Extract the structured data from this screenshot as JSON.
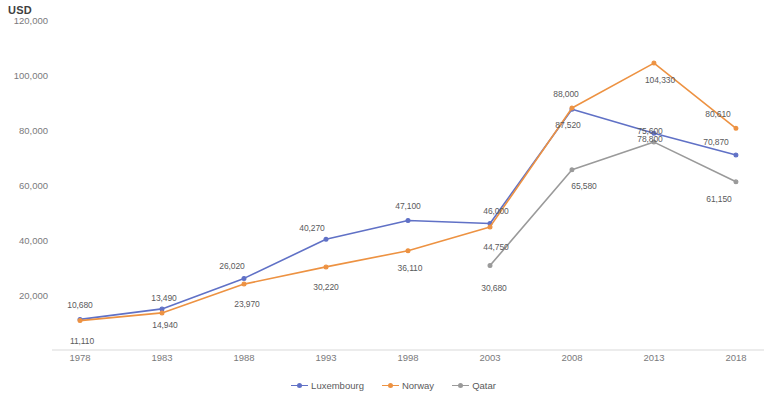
{
  "chart_data": {
    "type": "line",
    "title": "",
    "ylabel": "USD",
    "xlabel": "",
    "ylim": [
      0,
      120000
    ],
    "ytick_labels": [
      "120,000",
      "100,000",
      "80,000",
      "60,000",
      "40,000",
      "20,000"
    ],
    "ytick_values": [
      120000,
      100000,
      80000,
      60000,
      40000,
      20000
    ],
    "categories": [
      "1978",
      "1983",
      "1988",
      "1993",
      "1998",
      "2003",
      "2008",
      "2013",
      "2018"
    ],
    "x": [
      1978,
      1983,
      1988,
      1993,
      1998,
      2003,
      2008,
      2013,
      2018
    ],
    "grid": false,
    "legend_position": "bottom",
    "series": [
      {
        "name": "Luxembourg",
        "color": "#6071c6",
        "values": [
          11110,
          14940,
          26020,
          40270,
          47100,
          46000,
          87520,
          78800,
          70870
        ],
        "labels": [
          "11,110",
          "14,940",
          "26,020",
          "40,270",
          "47,100",
          "46,000",
          "87,520",
          "78,800",
          "70,870"
        ]
      },
      {
        "name": "Norway",
        "color": "#ed9242",
        "values": [
          10680,
          13490,
          23970,
          30220,
          36110,
          44750,
          88000,
          104330,
          80610
        ],
        "labels": [
          "10,680",
          "13,490",
          "23,970",
          "30,220",
          "36,110",
          "44,750",
          "88,000",
          "104,330",
          "80,610"
        ]
      },
      {
        "name": "Qatar",
        "color": "#9a9a9a",
        "values": [
          null,
          null,
          null,
          null,
          null,
          30680,
          65580,
          75600,
          61150
        ],
        "labels": [
          null,
          null,
          null,
          null,
          null,
          "30,680",
          "65,580",
          "75,600",
          "61,150"
        ]
      }
    ],
    "point_labels": [
      {
        "text": "10,680",
        "x": 1978,
        "y": 10680,
        "dx": 0,
        "dy": -16,
        "series": "Norway"
      },
      {
        "text": "11,110",
        "x": 1978,
        "y": 11110,
        "dx": 2,
        "dy": 22,
        "series": "Luxembourg"
      },
      {
        "text": "13,490",
        "x": 1983,
        "y": 13490,
        "dx": 2,
        "dy": -15,
        "series": "Norway"
      },
      {
        "text": "14,940",
        "x": 1983,
        "y": 14940,
        "dx": 3,
        "dy": 16,
        "series": "Luxembourg"
      },
      {
        "text": "26,020",
        "x": 1988,
        "y": 26020,
        "dx": -12,
        "dy": -12,
        "series": "Luxembourg"
      },
      {
        "text": "23,970",
        "x": 1988,
        "y": 23970,
        "dx": 3,
        "dy": 20,
        "series": "Norway"
      },
      {
        "text": "40,270",
        "x": 1993,
        "y": 40270,
        "dx": -14,
        "dy": -11,
        "series": "Luxembourg"
      },
      {
        "text": "30,220",
        "x": 1993,
        "y": 30220,
        "dx": 0,
        "dy": 20,
        "series": "Norway"
      },
      {
        "text": "47,100",
        "x": 1998,
        "y": 47100,
        "dx": 0,
        "dy": -14,
        "series": "Luxembourg"
      },
      {
        "text": "36,110",
        "x": 1998,
        "y": 36110,
        "dx": 2,
        "dy": 17,
        "series": "Norway"
      },
      {
        "text": "46,000",
        "x": 2003,
        "y": 46000,
        "dx": 6,
        "dy": -13,
        "series": "Luxembourg"
      },
      {
        "text": "44,750",
        "x": 2003,
        "y": 44750,
        "dx": 6,
        "dy": 20,
        "series": "Norway"
      },
      {
        "text": "30,680",
        "x": 2003,
        "y": 30680,
        "dx": 4,
        "dy": 22,
        "series": "Qatar"
      },
      {
        "text": "88,000",
        "x": 2008,
        "y": 88000,
        "dx": -6,
        "dy": -14,
        "series": "Norway"
      },
      {
        "text": "87,520",
        "x": 2008,
        "y": 87520,
        "dx": -4,
        "dy": 16,
        "series": "Luxembourg"
      },
      {
        "text": "65,580",
        "x": 2008,
        "y": 65580,
        "dx": 12,
        "dy": 16,
        "series": "Qatar"
      },
      {
        "text": "104,330",
        "x": 2013,
        "y": 104330,
        "dx": 6,
        "dy": 17,
        "series": "Norway"
      },
      {
        "text": "75,600",
        "x": 2013,
        "y": 75600,
        "dx": -4,
        "dy": -11,
        "series": "Qatar"
      },
      {
        "text": "78,800",
        "x": 2013,
        "y": 78800,
        "dx": -4,
        "dy": 6,
        "series": "Luxembourg"
      },
      {
        "text": "80,610",
        "x": 2018,
        "y": 80610,
        "dx": -18,
        "dy": -14,
        "series": "Norway"
      },
      {
        "text": "70,870",
        "x": 2018,
        "y": 70870,
        "dx": -20,
        "dy": -13,
        "series": "Luxembourg"
      },
      {
        "text": "61,150",
        "x": 2018,
        "y": 61150,
        "dx": -17,
        "dy": 17,
        "series": "Qatar"
      }
    ],
    "legend": [
      {
        "label": "Luxembourg",
        "color": "#6071c6"
      },
      {
        "label": "Norway",
        "color": "#ed9242"
      },
      {
        "label": "Qatar",
        "color": "#9a9a9a"
      }
    ]
  }
}
